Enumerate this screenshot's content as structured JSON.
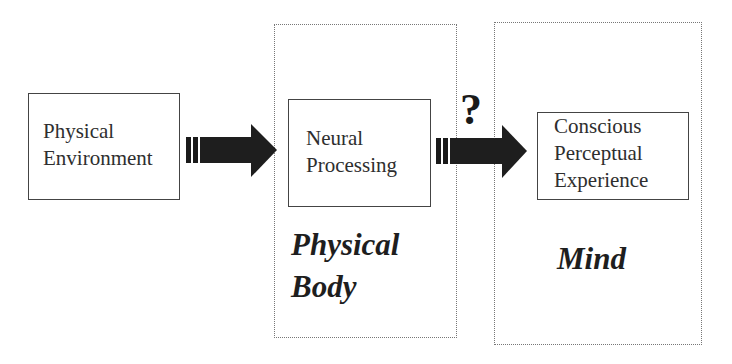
{
  "diagram": {
    "nodes": [
      {
        "id": "physical-environment",
        "lines": [
          "Physical",
          "Environment"
        ]
      },
      {
        "id": "neural-processing",
        "lines": [
          "Neural",
          "Processing"
        ]
      },
      {
        "id": "conscious-perceptual-experience",
        "lines": [
          "Conscious",
          "Perceptual",
          "Experience"
        ]
      }
    ],
    "groups": [
      {
        "id": "physical-body",
        "lines": [
          "Physical",
          "Body"
        ],
        "contains": [
          "neural-processing"
        ]
      },
      {
        "id": "mind",
        "lines": [
          "Mind"
        ],
        "contains": [
          "conscious-perceptual-experience"
        ]
      }
    ],
    "edges": [
      {
        "from": "physical-environment",
        "to": "neural-processing",
        "label": ""
      },
      {
        "from": "neural-processing",
        "to": "conscious-perceptual-experience",
        "label": "?"
      }
    ],
    "colors": {
      "arrow": "#1a1a1a",
      "border": "#444444",
      "dotted": "#777777"
    }
  }
}
